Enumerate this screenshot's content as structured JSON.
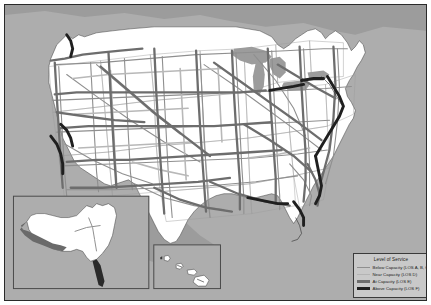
{
  "map": {
    "title": "United States National Highway System Level of Service",
    "background_color": "#adadad",
    "land_color": "#ffffff",
    "water_color": "#9a9a9a",
    "border_color": "#2a2a2a",
    "state_line_color": "#9a9a9a"
  },
  "legend": {
    "title": "Level of Service",
    "background_color": "#c9c9c9",
    "border_color": "#3a3a3a",
    "items": [
      {
        "label": "Below Capacity (LOS A, B, C)",
        "color": "#8f8f8f",
        "width": 1.1,
        "los": "A, B, C"
      },
      {
        "label": "Near Capacity (LOS D)",
        "color": "#b4b4b4",
        "width": 1.6,
        "los": "D"
      },
      {
        "label": "At Capacity (LOS E)",
        "color": "#6d6d6d",
        "width": 2.2,
        "los": "E"
      },
      {
        "label": "Above Capacity (LOS F)",
        "color": "#1f1f1f",
        "width": 2.8,
        "los": "F"
      }
    ]
  },
  "insets": [
    {
      "name": "alaska",
      "border_color": "#4a4a4a"
    },
    {
      "name": "hawaii",
      "border_color": "#4a4a4a"
    }
  ]
}
